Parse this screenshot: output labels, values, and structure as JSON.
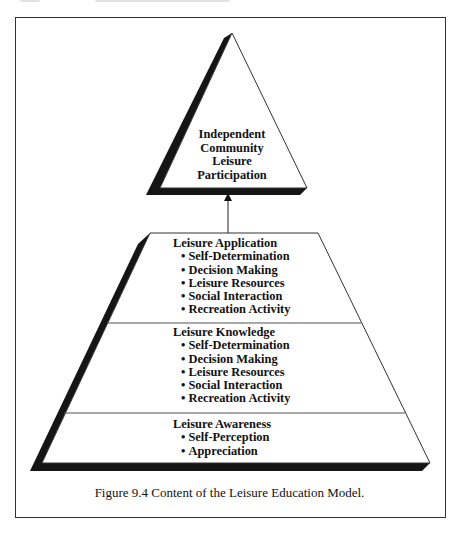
{
  "figure": {
    "caption": "Figure 9.4  Content of the Leisure Education Model.",
    "apex": {
      "lines": [
        "Independent",
        "Community",
        "Leisure",
        "Participation"
      ]
    },
    "arrow": {
      "direction": "up",
      "from": "Leisure Application",
      "to": "Independent Community Leisure Participation"
    },
    "sections": [
      {
        "heading": "Leisure Application",
        "items": [
          "Self-Determination",
          "Decision Making",
          "Leisure Resources",
          "Social Interaction",
          "Recreation Activity"
        ]
      },
      {
        "heading": "Leisure Knowledge",
        "items": [
          "Self-Determination",
          "Decision Making",
          "Leisure Resources",
          "Social Interaction",
          "Recreation Activity"
        ]
      },
      {
        "heading": "Leisure Awareness",
        "items": [
          "Self-Perception",
          "Appreciation"
        ]
      }
    ],
    "colors": {
      "outline": "#333333",
      "shadow": "#151515",
      "fill": "#ffffff",
      "divider": "#555555"
    }
  }
}
